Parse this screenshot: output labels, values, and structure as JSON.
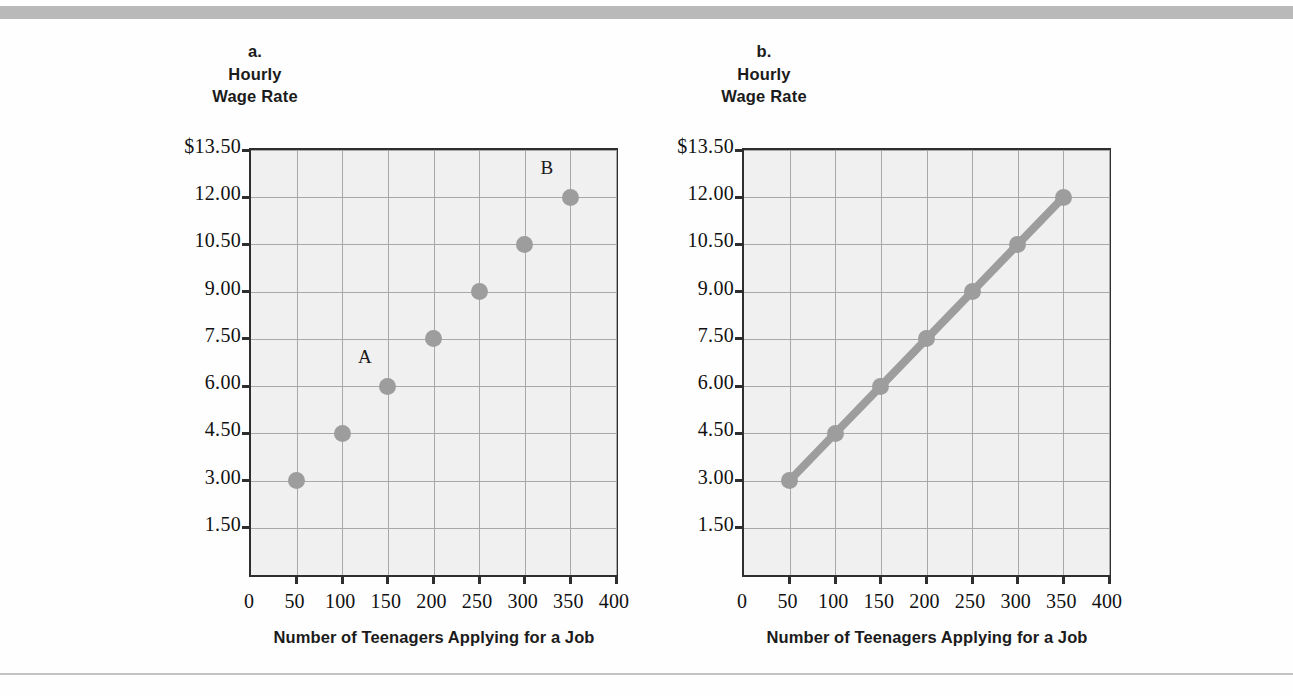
{
  "figure": {
    "panels": [
      {
        "id": "a",
        "letter": "a.",
        "title_line1": "Hourly",
        "title_line2": "Wage Rate",
        "axis_title": "Number of Teenagers Applying for a Job"
      },
      {
        "id": "b",
        "letter": "b.",
        "title_line1": "Hourly",
        "title_line2": "Wage Rate",
        "axis_title": "Number of Teenagers Applying for a Job"
      }
    ]
  },
  "colors": {
    "marker": "#9d9d9d",
    "line": "#9d9d9d",
    "grid": "#a8a8a8",
    "frame": "#2e2e2e",
    "plot_background": "#f0f0f0",
    "page_background": "#fefefe",
    "top_bar": "#b9b9b9"
  },
  "chart_data": [
    {
      "type": "scatter",
      "panel": "a",
      "title": "a. Hourly Wage Rate",
      "xlabel": "Number of Teenagers Applying for a Job",
      "ylabel": "Hourly Wage Rate",
      "x": [
        50,
        100,
        150,
        200,
        250,
        300,
        350
      ],
      "values": [
        3.0,
        4.5,
        6.0,
        7.5,
        9.0,
        10.5,
        12.0
      ],
      "xlim": [
        0,
        400
      ],
      "ylim": [
        0,
        13.5
      ],
      "xticks": [
        0,
        50,
        100,
        150,
        200,
        250,
        300,
        350,
        400
      ],
      "xticklabels": [
        "0",
        "50",
        "100",
        "150",
        "200",
        "250",
        "300",
        "350",
        "400"
      ],
      "yticks": [
        1.5,
        3.0,
        4.5,
        6.0,
        7.5,
        9.0,
        10.5,
        12.0,
        13.5
      ],
      "yticklabels": [
        "1.50",
        "3.00",
        "4.50",
        "6.00",
        "7.50",
        "9.00",
        "10.50",
        "12.00",
        "$13.50"
      ],
      "grid": true,
      "legend": "none",
      "annotations": [
        {
          "text": "A",
          "x": 150,
          "y": 6.0
        },
        {
          "text": "B",
          "x": 350,
          "y": 12.0
        }
      ]
    },
    {
      "type": "line",
      "panel": "b",
      "title": "b. Hourly Wage Rate",
      "xlabel": "Number of Teenagers Applying for a Job",
      "ylabel": "Hourly Wage Rate",
      "x": [
        50,
        100,
        150,
        200,
        250,
        300,
        350
      ],
      "values": [
        3.0,
        4.5,
        6.0,
        7.5,
        9.0,
        10.5,
        12.0
      ],
      "xlim": [
        0,
        400
      ],
      "ylim": [
        0,
        13.5
      ],
      "xticks": [
        0,
        50,
        100,
        150,
        200,
        250,
        300,
        350,
        400
      ],
      "xticklabels": [
        "0",
        "50",
        "100",
        "150",
        "200",
        "250",
        "300",
        "350",
        "400"
      ],
      "yticks": [
        1.5,
        3.0,
        4.5,
        6.0,
        7.5,
        9.0,
        10.5,
        12.0,
        13.5
      ],
      "yticklabels": [
        "1.50",
        "3.00",
        "4.50",
        "6.00",
        "7.50",
        "9.00",
        "10.50",
        "12.00",
        "$13.50"
      ],
      "grid": true,
      "legend": "none",
      "annotations": []
    }
  ]
}
